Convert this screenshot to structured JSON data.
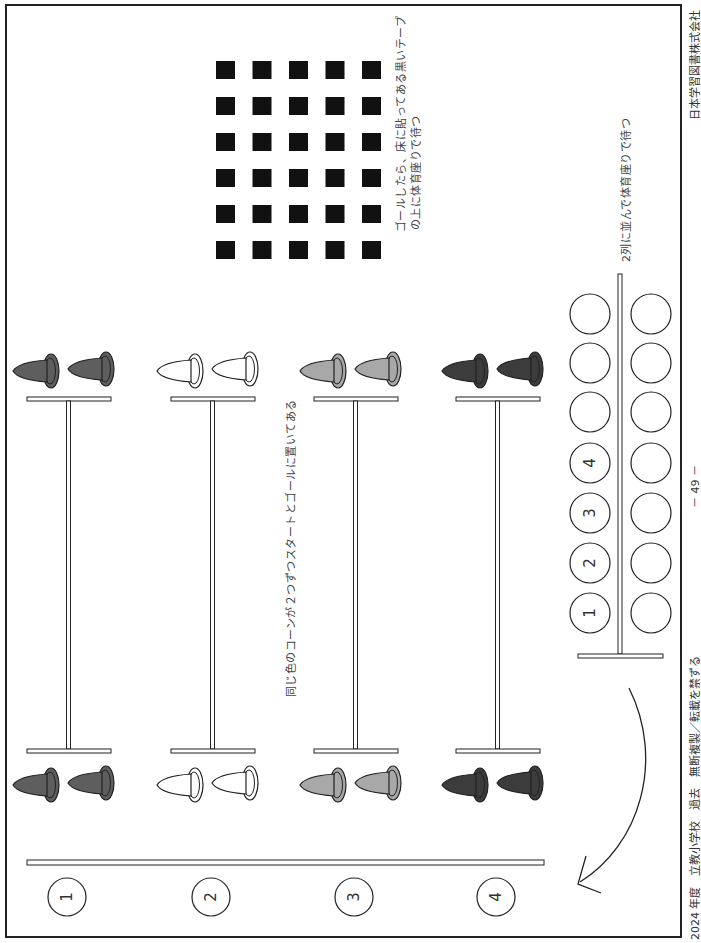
{
  "footer": {
    "left": "2024 年度　立教小学校　過去　無断複製／転載を禁ずる",
    "page_number": "－ 49 －",
    "publisher": "日本学習図書株式会社"
  },
  "labels": {
    "goal_tape": "ゴールしたら、床に貼ってある黒いテープ",
    "goal_tape_line2": "の上に体育座りで待つ",
    "waiting_line": "2列に並んで体育座りで待つ",
    "cones_note": "同じ色のコーンが２つずつスタートとゴールに置いてある"
  },
  "lanes": [
    {
      "number": "1",
      "cone_color": "#5e5e5e"
    },
    {
      "number": "2",
      "cone_color": "#ffffff"
    },
    {
      "number": "3",
      "cone_color": "#a8a8a8"
    },
    {
      "number": "4",
      "cone_color": "#3c3c3c"
    }
  ],
  "waiting_area": {
    "left_column_labels": [
      "1",
      "2",
      "3",
      "4",
      "",
      "",
      ""
    ],
    "right_column_count": 7
  },
  "tape_grid": {
    "rows": 6,
    "cols": 5,
    "color": "#111111"
  }
}
